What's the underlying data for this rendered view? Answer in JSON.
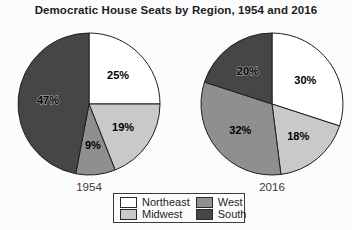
{
  "title": "Democratic House Seats by Region, 1954 and 2016",
  "chart_data": {
    "type": "pie",
    "title": "Democratic House Seats by Region, 1954 and 2016",
    "categories": [
      "Northeast",
      "Midwest",
      "West",
      "South"
    ],
    "colors": [
      "#ffffff",
      "#c9c9c9",
      "#8f8f8f",
      "#464646"
    ],
    "slice_outline_color": "#1f1f1f",
    "label_color": "#000000",
    "value_suffix": "%",
    "legend_position": "bottom",
    "start_angle_deg": 0,
    "direction": "clockwise",
    "charts": [
      {
        "label": "1954",
        "values": [
          25,
          19,
          9,
          47
        ]
      },
      {
        "label": "2016",
        "values": [
          30,
          18,
          32,
          20
        ]
      }
    ]
  }
}
